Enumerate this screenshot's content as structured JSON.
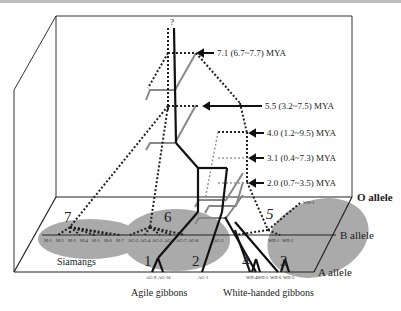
{
  "figure": {
    "root_label": "?",
    "time_labels": [
      {
        "text": "7.1 (6.7~7.7) MYA",
        "y": 50
      },
      {
        "text": "5.5 (3.2~7.5) MYA",
        "y": 103
      },
      {
        "text": "4.0 (1.2~9.5) MYA",
        "y": 132
      },
      {
        "text": "3.1 (0.4~7.3) MYA",
        "y": 157
      },
      {
        "text": "2.0 (0.7~3.5) MYA",
        "y": 182
      }
    ],
    "planes": {
      "o": "O allele",
      "b": "B allele",
      "a": "A allele"
    },
    "clusters": {
      "c7": "7",
      "c6": "6",
      "c1": "1",
      "c2": "2",
      "c4": "4",
      "c3": "3",
      "c5": "5"
    },
    "groups": {
      "siamangs": "Siamangs",
      "agile": "Agile gibbons",
      "white_handed": "White-handed gibbons"
    },
    "b_plane_taxa": [
      "SI-1",
      "SI-2",
      "SI-3",
      "SI-4",
      "SI-5",
      "SI-6",
      "SI-7",
      "AG-2",
      "AG-4",
      "AG-5",
      "AG-6",
      "AG-7",
      "AG-8",
      "AG-3",
      "WH-1",
      "WH-2"
    ],
    "a_plane_taxa": [
      "AG-9",
      "AG-10",
      "AG-1",
      "WH-4",
      "WH-5",
      "WH-6",
      "WH-3"
    ],
    "o_plane_taxa": [
      "WH-1"
    ],
    "colors": {
      "cluster_fill": "#a9a9a9",
      "line_dark": "#111111",
      "line_gray": "#808080",
      "plane_line": "#222222"
    }
  }
}
